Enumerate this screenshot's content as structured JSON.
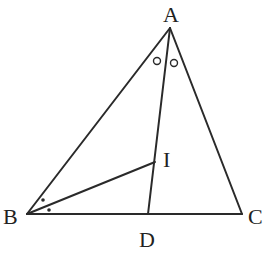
{
  "figure": {
    "type": "triangle-angle-bisectors",
    "points": {
      "A": {
        "label": "A",
        "x": 170,
        "y": 28
      },
      "B": {
        "label": "B",
        "x": 27,
        "y": 214
      },
      "C": {
        "label": "C",
        "x": 242,
        "y": 214
      },
      "D": {
        "label": "D",
        "x": 148,
        "y": 214
      },
      "I": {
        "label": "I",
        "x": 155,
        "y": 162
      }
    },
    "segments": [
      "AB",
      "AC",
      "BC",
      "AD",
      "BI"
    ],
    "angle_marks": {
      "A": "circle (∠BAD = ∠DAC)",
      "B": "dot (∠ABI = ∠IBC)"
    }
  },
  "labels": {
    "A": "A",
    "B": "B",
    "C": "C",
    "D": "D",
    "I": "I"
  }
}
